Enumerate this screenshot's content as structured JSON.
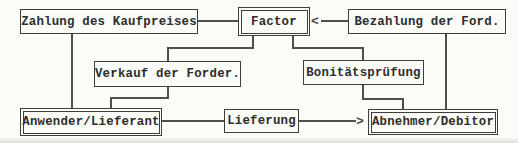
{
  "diagram": {
    "nodes": {
      "zahlung": {
        "label": "Zahlung des Kaufpreises"
      },
      "factor": {
        "label": "Factor"
      },
      "bezahlung": {
        "label": "Bezahlung der Ford."
      },
      "verkauf": {
        "label": "Verkauf der Forder."
      },
      "bonitaet": {
        "label": "Bonitätsprüfung"
      },
      "anwender": {
        "label": "Anwender/Lieferant"
      },
      "lieferung": {
        "label": "Lieferung"
      },
      "abnehmer": {
        "label": "Abnehmer/Debitor"
      }
    },
    "icons": {
      "arrow_left": "<",
      "arrow_right": ">"
    },
    "edges": [
      {
        "from": "Zahlung des Kaufpreises",
        "to": "Factor",
        "style": "plain"
      },
      {
        "from": "Bezahlung der Ford.",
        "to": "Factor",
        "style": "arrow-into-factor"
      },
      {
        "from": "Factor",
        "to": "Verkauf der Forder.",
        "style": "plain"
      },
      {
        "from": "Factor",
        "to": "Bonitätsprüfung",
        "style": "plain"
      },
      {
        "from": "Zahlung des Kaufpreises",
        "to": "Anwender/Lieferant",
        "style": "plain"
      },
      {
        "from": "Verkauf der Forder.",
        "to": "Anwender/Lieferant",
        "style": "plain"
      },
      {
        "from": "Anwender/Lieferant",
        "to": "Lieferung",
        "style": "plain"
      },
      {
        "from": "Lieferung",
        "to": "Abnehmer/Debitor",
        "style": "arrow-into-abnehmer"
      },
      {
        "from": "Bonitätsprüfung",
        "to": "Abnehmer/Debitor",
        "style": "plain"
      },
      {
        "from": "Bezahlung der Ford.",
        "to": "Abnehmer/Debitor",
        "style": "plain"
      }
    ],
    "colors": {
      "background": "#fbfbf8",
      "line": "#4e4e4c",
      "border": "#3d3d3b",
      "text": "#2d2d2b"
    }
  }
}
